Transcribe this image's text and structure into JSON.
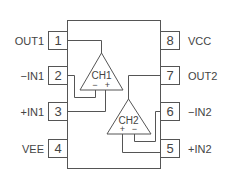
{
  "diagram": {
    "type": "dual-op-amp-pinout",
    "package_pins": 8,
    "pins": [
      {
        "number": "1",
        "label": "OUT1"
      },
      {
        "number": "2",
        "label": "−IN1"
      },
      {
        "number": "3",
        "label": "+IN1"
      },
      {
        "number": "4",
        "label": "VEE"
      },
      {
        "number": "5",
        "label": "+IN2"
      },
      {
        "number": "6",
        "label": "−IN2"
      },
      {
        "number": "7",
        "label": "OUT2"
      },
      {
        "number": "8",
        "label": "VCC"
      }
    ],
    "channels": [
      {
        "label": "CH1",
        "inv": "−",
        "noninv": "+"
      },
      {
        "label": "CH2",
        "inv": "−",
        "noninv": "+"
      }
    ],
    "colors": {
      "stroke": "#555555",
      "text": "#444444",
      "background": "#ffffff"
    }
  }
}
